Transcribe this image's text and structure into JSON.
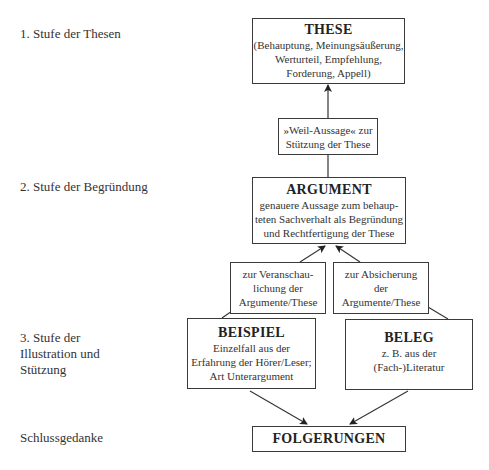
{
  "stages": [
    {
      "label": "1. Stufe der Thesen"
    },
    {
      "label": "2. Stufe der Begründung"
    },
    {
      "label": "3. Stufe der\nIllustration und\nStützung"
    },
    {
      "label": "Schlussgedanke"
    }
  ],
  "boxes": {
    "these": {
      "title": "THESE",
      "desc": "(Behauptung, Meinungsäußerung,\nWerturteil, Empfehlung,\nForderung, Appell)"
    },
    "weil": {
      "desc": "»Weil-Aussage« zur\nStützung der These"
    },
    "argument": {
      "title": "ARGUMENT",
      "desc": "genauere Aussage zum behaup-\nteten Sachverhalt als Begründung\nund Rechtfertigung der These"
    },
    "veranschaulichung": {
      "desc": "zur Veranschau-\nlichung der\nArgumente/These"
    },
    "absicherung": {
      "desc": "zur Absicherung\nder\nArgumente/These"
    },
    "beispiel": {
      "title": "BEISPIEL",
      "desc": "Einzelfall aus der\nErfahrung der Hörer/Leser;\nArt Unterargument"
    },
    "beleg": {
      "title": "BELEG",
      "desc": "z. B. aus der\n(Fach-)Literatur"
    },
    "folgerungen": {
      "title": "FOLGERUNGEN"
    }
  },
  "colors": {
    "line": "#3a3a3a",
    "text": "#2a2a2a",
    "background": "#ffffff"
  }
}
